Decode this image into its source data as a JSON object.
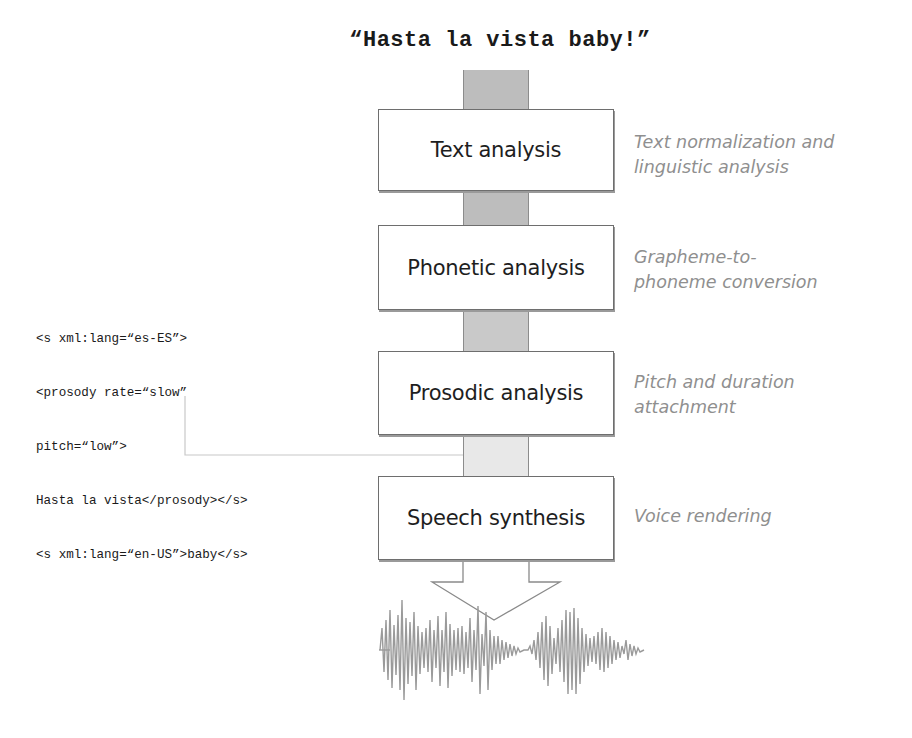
{
  "diagram": {
    "input_text": "“Hasta la vista baby!”",
    "stages": [
      {
        "label": "Text analysis",
        "description_lines": [
          "Text normalization and",
          "linguistic analysis"
        ]
      },
      {
        "label": "Phonetic analysis",
        "description_lines": [
          "Grapheme-to-",
          "phoneme conversion"
        ]
      },
      {
        "label": "Prosodic analysis",
        "description_lines": [
          "Pitch and duration",
          "attachment"
        ]
      },
      {
        "label": "Speech synthesis",
        "description_lines": [
          "Voice rendering"
        ]
      }
    ],
    "ssml_markup_lines": [
      "<s xml:lang=“es-ES”>",
      "<prosody rate=“slow”",
      "pitch=“low”>",
      "Hasta la vista</prosody></s>",
      "<s xml:lang=“en-US”>baby</s>"
    ],
    "output": "waveform-icon",
    "colors": {
      "box_border": "#6e6e6e",
      "column_dark": "#bdbdbd",
      "column_light": "#e8e8e8",
      "description_text": "#8f8f8f",
      "waveform": "#9a9a9a",
      "connector": "#c8c8c8"
    }
  }
}
